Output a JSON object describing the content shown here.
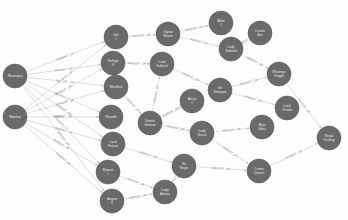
{
  "graph": {
    "relationship_label": "PARENT_OF",
    "node_color": "#6a6a6a",
    "edge_color": "#c9c9c9",
    "nodes": [
      {
        "id": "n0",
        "label": "Rhaenyra",
        "x": 15,
        "y": 76
      },
      {
        "id": "n1",
        "label": "Maekar",
        "x": 15,
        "y": 117
      },
      {
        "id": "n2",
        "label": "Jon I",
        "x": 116,
        "y": 37
      },
      {
        "id": "n3",
        "label": "Tarleyn II",
        "x": 113,
        "y": 63
      },
      {
        "id": "n4",
        "label": "Marillion",
        "x": 116,
        "y": 87
      },
      {
        "id": "n5",
        "label": "Rhaelle",
        "x": 111,
        "y": 117
      },
      {
        "id": "n6",
        "label": "Lord Falcon",
        "x": 113,
        "y": 144
      },
      {
        "id": "n7",
        "label": "Elaeon I",
        "x": 108,
        "y": 172
      },
      {
        "id": "n8",
        "label": "Aegon II",
        "x": 112,
        "y": 201
      },
      {
        "id": "n9",
        "label": "Olyvar Moore",
        "x": 168,
        "y": 34
      },
      {
        "id": "n10",
        "label": "Alton I",
        "x": 221,
        "y": 23
      },
      {
        "id": "n11",
        "label": "Lady Tarbeck",
        "x": 231,
        "y": 49
      },
      {
        "id": "n12",
        "label": "Cassie Bar",
        "x": 260,
        "y": 33
      },
      {
        "id": "n13",
        "label": "Lord Tarbeck",
        "x": 162,
        "y": 64
      },
      {
        "id": "n14",
        "label": "Rhaenys Knight",
        "x": 279,
        "y": 74
      },
      {
        "id": "n15",
        "label": "Sir Velaryon",
        "x": 220,
        "y": 90
      },
      {
        "id": "n16",
        "label": "Aerys I",
        "x": 192,
        "y": 101
      },
      {
        "id": "n17",
        "label": "Lord Tristan",
        "x": 287,
        "y": 108
      },
      {
        "id": "n18",
        "label": "Dimitri Greene",
        "x": 150,
        "y": 123
      },
      {
        "id": "n19",
        "label": "Lady Grace",
        "x": 202,
        "y": 133
      },
      {
        "id": "n20",
        "label": "Alyn Velar",
        "x": 262,
        "y": 127
      },
      {
        "id": "n21",
        "label": "Royal Destiny",
        "x": 329,
        "y": 138
      },
      {
        "id": "n22",
        "label": "Sir Regis",
        "x": 184,
        "y": 166
      },
      {
        "id": "n23",
        "label": "Crown Queen",
        "x": 259,
        "y": 171
      },
      {
        "id": "n24",
        "label": "Lady Amara",
        "x": 165,
        "y": 192
      }
    ],
    "edges": [
      [
        "n0",
        "n2"
      ],
      [
        "n0",
        "n3"
      ],
      [
        "n0",
        "n4"
      ],
      [
        "n0",
        "n5"
      ],
      [
        "n0",
        "n6"
      ],
      [
        "n0",
        "n7"
      ],
      [
        "n0",
        "n8"
      ],
      [
        "n1",
        "n2"
      ],
      [
        "n1",
        "n3"
      ],
      [
        "n1",
        "n4"
      ],
      [
        "n1",
        "n5"
      ],
      [
        "n1",
        "n6"
      ],
      [
        "n1",
        "n7"
      ],
      [
        "n1",
        "n8"
      ],
      [
        "n2",
        "n9"
      ],
      [
        "n9",
        "n10"
      ],
      [
        "n9",
        "n11"
      ],
      [
        "n11",
        "n12"
      ],
      [
        "n11",
        "n14"
      ],
      [
        "n3",
        "n13"
      ],
      [
        "n13",
        "n15"
      ],
      [
        "n4",
        "n18"
      ],
      [
        "n18",
        "n13"
      ],
      [
        "n18",
        "n16"
      ],
      [
        "n18",
        "n19"
      ],
      [
        "n15",
        "n14"
      ],
      [
        "n15",
        "n17"
      ],
      [
        "n14",
        "n21"
      ],
      [
        "n19",
        "n20"
      ],
      [
        "n19",
        "n23"
      ],
      [
        "n6",
        "n22"
      ],
      [
        "n22",
        "n23"
      ],
      [
        "n7",
        "n24"
      ],
      [
        "n8",
        "n24"
      ],
      [
        "n24",
        "n22"
      ],
      [
        "n23",
        "n21"
      ]
    ]
  }
}
